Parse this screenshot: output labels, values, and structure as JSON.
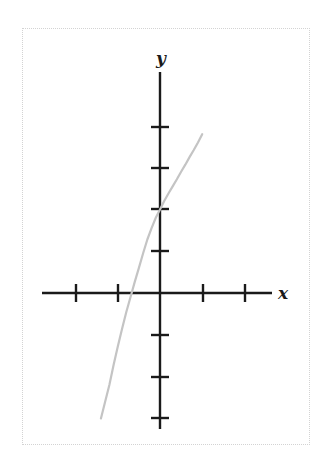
{
  "figure": {
    "name": "coordinate-plane-graph",
    "background_color": "#ffffff",
    "frame_color": "#d3d3d3",
    "axis_color": "#1a1a1a",
    "curve_color": "#c4c4c4"
  },
  "labels": {
    "x_axis": "x",
    "y_axis": "y"
  },
  "chart_data": {
    "type": "line",
    "title": "",
    "xlabel": "x",
    "ylabel": "y",
    "grid": false,
    "legend": false,
    "xlim": [
      -3,
      3
    ],
    "ylim": [
      -3,
      4
    ],
    "x_ticks": [
      -2,
      -1,
      1,
      2
    ],
    "y_ticks": [
      -3,
      -2,
      -1,
      1,
      2,
      3,
      4
    ],
    "tick_labels_shown": false,
    "y_intercept": 2,
    "x_intercept": -1.15,
    "series": [
      {
        "name": "curve",
        "x": [
          -1.4,
          -1.3,
          -1.2,
          -1.1,
          -1.0,
          -0.9,
          -0.8,
          -0.7,
          -0.6,
          -0.5,
          -0.4,
          -0.3,
          -0.2,
          -0.1,
          0.0,
          0.1,
          0.2,
          0.3,
          0.4,
          0.5,
          0.6,
          0.7,
          0.8,
          0.9,
          1.0
        ],
        "y": [
          -3.0,
          -2.6,
          -2.2,
          -1.72,
          -1.28,
          -0.86,
          -0.46,
          -0.1,
          0.26,
          0.6,
          0.95,
          1.28,
          1.55,
          1.8,
          2.0,
          2.2,
          2.38,
          2.55,
          2.72,
          2.9,
          3.07,
          3.25,
          3.42,
          3.6,
          3.8
        ]
      }
    ]
  }
}
